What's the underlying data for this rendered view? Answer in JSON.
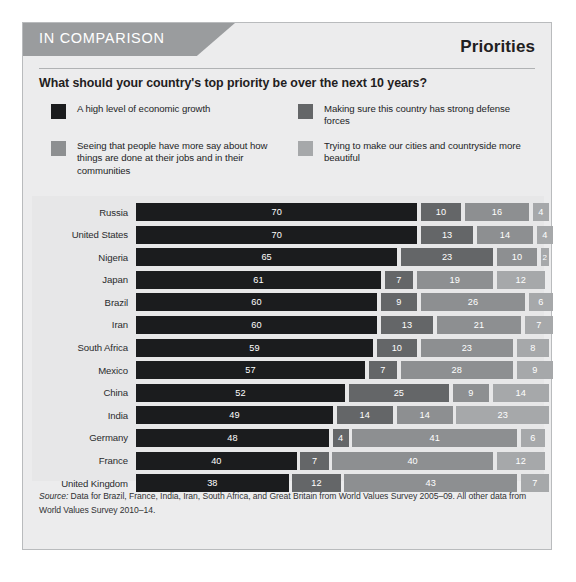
{
  "header": {
    "banner_label": "IN COMPARISON",
    "section_title": "Priorities"
  },
  "question": "What should your country's top priority be over the next 10 years?",
  "legend": [
    {
      "label": "A high level of economic growth",
      "color": "#1b1c1e"
    },
    {
      "label": "Making sure this country has strong defense forces",
      "color": "#646668"
    },
    {
      "label": "Seeing that people have more say about how things are done at their jobs and in their communities",
      "color": "#8d8f91"
    },
    {
      "label": "Trying to make our cities and countryside more beautiful",
      "color": "#a6a8aa"
    }
  ],
  "source": {
    "prefix": "Source:",
    "text": " Data for Brazil, France, India, Iran, South Africa, and Great Britain from World Values Survey 2005–09. All other data from World Values Survey 2010–14."
  },
  "chart_data": {
    "type": "bar",
    "subtype": "stacked-horizontal",
    "title": "Priorities",
    "question": "What should your country's top priority be over the next 10 years?",
    "xlabel": "",
    "ylabel": "",
    "xlim": [
      0,
      100
    ],
    "grid": false,
    "legend_position": "top",
    "unit": "percent",
    "series": [
      {
        "name": "A high level of economic growth",
        "color": "#1b1c1e",
        "values": [
          70,
          70,
          65,
          61,
          60,
          60,
          59,
          57,
          52,
          49,
          48,
          40,
          38
        ]
      },
      {
        "name": "Making sure this country has strong defense forces",
        "color": "#646668",
        "values": [
          10,
          13,
          23,
          7,
          9,
          13,
          10,
          7,
          25,
          14,
          4,
          7,
          12
        ]
      },
      {
        "name": "Seeing that people have more say about how things are done at their jobs and in their communities",
        "color": "#8d8f91",
        "values": [
          16,
          14,
          10,
          19,
          26,
          21,
          23,
          28,
          9,
          14,
          41,
          40,
          43
        ]
      },
      {
        "name": "Trying to make our cities and countryside more beautiful",
        "color": "#a6a8aa",
        "values": [
          4,
          4,
          2,
          12,
          6,
          7,
          8,
          9,
          14,
          23,
          6,
          12,
          7
        ]
      }
    ],
    "categories": [
      "Russia",
      "United States",
      "Nigeria",
      "Japan",
      "Brazil",
      "Iran",
      "South Africa",
      "Mexico",
      "China",
      "India",
      "Germany",
      "France",
      "United Kingdom"
    ],
    "rows": [
      {
        "country": "Russia",
        "values": [
          70,
          10,
          16,
          4
        ]
      },
      {
        "country": "United States",
        "values": [
          70,
          13,
          14,
          4
        ]
      },
      {
        "country": "Nigeria",
        "values": [
          65,
          23,
          10,
          2
        ]
      },
      {
        "country": "Japan",
        "values": [
          61,
          7,
          19,
          12
        ]
      },
      {
        "country": "Brazil",
        "values": [
          60,
          9,
          26,
          6
        ]
      },
      {
        "country": "Iran",
        "values": [
          60,
          13,
          21,
          7
        ]
      },
      {
        "country": "South Africa",
        "values": [
          59,
          10,
          23,
          8
        ]
      },
      {
        "country": "Mexico",
        "values": [
          57,
          7,
          28,
          9
        ]
      },
      {
        "country": "China",
        "values": [
          52,
          25,
          9,
          14
        ]
      },
      {
        "country": "India",
        "values": [
          49,
          14,
          14,
          23
        ]
      },
      {
        "country": "Germany",
        "values": [
          48,
          4,
          41,
          6
        ]
      },
      {
        "country": "France",
        "values": [
          40,
          7,
          40,
          12
        ]
      },
      {
        "country": "United Kingdom",
        "values": [
          38,
          12,
          43,
          7
        ]
      }
    ]
  }
}
